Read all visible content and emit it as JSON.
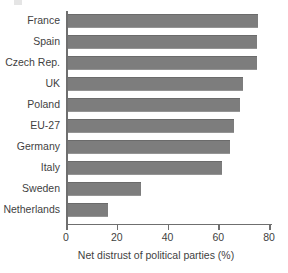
{
  "chart_data": {
    "type": "bar",
    "orientation": "horizontal",
    "title": "",
    "xlabel": "Net distrust of political parties (%)",
    "ylabel": "",
    "categories": [
      "France",
      "Spain",
      "Czech Rep.",
      "UK",
      "Poland",
      "EU-27",
      "Germany",
      "Italy",
      "Sweden",
      "Netherlands"
    ],
    "values": [
      75,
      74.5,
      74.5,
      69,
      68,
      65.5,
      64,
      61,
      29,
      16
    ],
    "xlim": [
      0,
      80
    ],
    "xticks": [
      0,
      20,
      40,
      60,
      80
    ],
    "xtick_labels": [
      "0",
      "20",
      "40",
      "60",
      "80"
    ],
    "grid": false,
    "legend": null,
    "bar_color": "#7d7d7d",
    "axis_color": "#6f6f6f",
    "text_color": "#3f3f3f",
    "background": "#ffffff"
  }
}
